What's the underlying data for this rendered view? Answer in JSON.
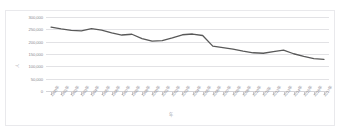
{
  "top_caption": "",
  "chart": {
    "yaxis_title": "人",
    "xaxis_title": "年",
    "line_color": "#595959",
    "gridline_color": "#e2e2e5",
    "plot_background": "#ffffff"
  },
  "chart_data": {
    "type": "line",
    "title": "",
    "xlabel": "年",
    "ylabel": "人",
    "grid": true,
    "legend": "none",
    "ylim": [
      0,
      300000
    ],
    "yticks": [
      0,
      50000,
      100000,
      150000,
      200000,
      250000,
      300000
    ],
    "ytick_labels": [
      "0",
      "50,000",
      "100,000",
      "150,000",
      "200,000",
      "250,000",
      "300,000"
    ],
    "categories": [
      "1990年",
      "1991年",
      "1992年",
      "1993年",
      "1994年",
      "1995年",
      "1996年",
      "1997年",
      "1998年",
      "1999年",
      "2000年",
      "2001年",
      "2002年",
      "2003年",
      "2004年",
      "2005年",
      "2006年",
      "2007年",
      "2008年",
      "2009年",
      "2010年",
      "2011年",
      "2012年",
      "2013年",
      "2014年",
      "2015年",
      "2016年",
      "2017年"
    ],
    "series": [
      {
        "name": "出生数",
        "values": [
          259000,
          252000,
          246000,
          244000,
          253000,
          247000,
          236000,
          227000,
          230000,
          212000,
          202000,
          204000,
          215000,
          228000,
          231000,
          225000,
          182000,
          176000,
          170000,
          162000,
          155000,
          153000,
          160000,
          166000,
          151000,
          140000,
          131000,
          128000
        ]
      }
    ]
  }
}
